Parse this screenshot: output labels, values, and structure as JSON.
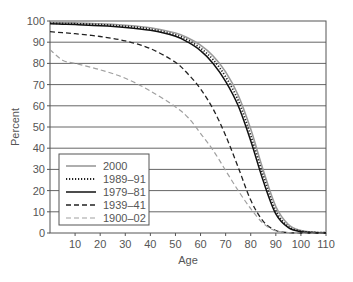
{
  "chart_data": {
    "type": "line",
    "title": "",
    "xlabel": "Age",
    "ylabel": "Percent",
    "xlim": [
      0,
      110
    ],
    "ylim": [
      0,
      100
    ],
    "xticks": [
      10,
      20,
      30,
      40,
      50,
      60,
      70,
      80,
      90,
      100,
      110
    ],
    "yticks": [
      0,
      10,
      20,
      30,
      40,
      50,
      60,
      70,
      80,
      90,
      100
    ],
    "grid": "horizontal",
    "legend_position": "lower-left",
    "x": [
      0,
      5,
      10,
      20,
      30,
      40,
      50,
      55,
      60,
      65,
      70,
      75,
      80,
      85,
      90,
      95,
      100,
      105,
      110
    ],
    "series": [
      {
        "name": "2000",
        "style": "solid-gray",
        "color": "#9a9a9a",
        "values": [
          99.3,
          99.2,
          99.1,
          98.7,
          98.0,
          96.8,
          94.3,
          92.0,
          88.6,
          83.5,
          76.0,
          65.0,
          49.0,
          29.5,
          12.5,
          4.0,
          1.2,
          0.4,
          0.2
        ]
      },
      {
        "name": "1989–91",
        "style": "dotted-black",
        "color": "#222222",
        "values": [
          99.0,
          98.8,
          98.7,
          98.3,
          97.5,
          96.2,
          93.5,
          91.0,
          87.2,
          81.8,
          73.7,
          62.5,
          46.0,
          27.0,
          10.5,
          3.0,
          0.9,
          0.3,
          0.1
        ]
      },
      {
        "name": "1979–81",
        "style": "solid-black",
        "color": "#111111",
        "values": [
          98.7,
          98.5,
          98.3,
          97.8,
          97.0,
          95.6,
          92.8,
          90.0,
          86.0,
          80.0,
          71.5,
          60.0,
          43.5,
          24.5,
          9.0,
          2.5,
          0.6,
          0.2,
          0.1
        ]
      },
      {
        "name": "1939–41",
        "style": "dashed-black",
        "color": "#222222",
        "values": [
          95.0,
          94.5,
          94.0,
          92.7,
          90.6,
          87.0,
          80.5,
          75.0,
          68.0,
          58.5,
          46.0,
          31.0,
          15.5,
          5.5,
          1.2,
          0.2,
          0.0,
          0.0,
          0.0
        ]
      },
      {
        "name": "1900–02",
        "style": "dashed-gray",
        "color": "#a0a0a0",
        "values": [
          86.5,
          81.5,
          80.0,
          77.0,
          73.0,
          67.0,
          59.5,
          54.5,
          47.0,
          39.0,
          29.5,
          20.0,
          11.5,
          4.5,
          1.0,
          0.2,
          0.0,
          0.0,
          0.0
        ]
      }
    ]
  }
}
